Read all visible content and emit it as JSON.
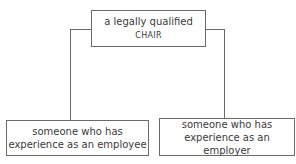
{
  "diagram": {
    "top": {
      "text": "a legally qualified",
      "smallcaps": "CHAIR"
    },
    "left": {
      "line1": "someone who has",
      "line2": "experience as an employee"
    },
    "right": {
      "line1": "someone who has",
      "line2": "experience as an employer"
    }
  },
  "colors": {
    "line": "#6a6a6a",
    "text": "#3a3a3a",
    "background": "#ffffff"
  }
}
